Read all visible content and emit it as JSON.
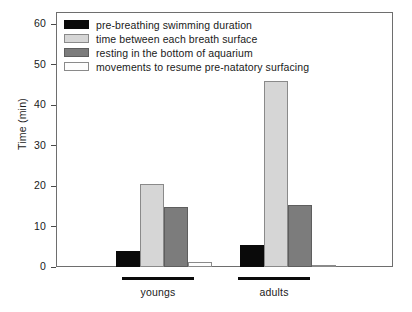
{
  "chart_data": {
    "type": "bar",
    "title": "",
    "xlabel": "",
    "ylabel": "Time (min)",
    "ylim": [
      0,
      63
    ],
    "yticks": [
      0,
      10,
      20,
      30,
      40,
      50,
      60
    ],
    "ytick_labels": [
      "0",
      "10",
      "20",
      "30",
      "40",
      "50",
      "60"
    ],
    "grid": false,
    "legend_position": "upper-left-inside",
    "categories": [
      "youngs",
      "adults"
    ],
    "series": [
      {
        "name": "pre-breathing swimming duration",
        "color": "#0a0a0a",
        "values": [
          4.0,
          5.4
        ]
      },
      {
        "name": "time between each breath surface",
        "color": "#d6d6d6",
        "values": [
          20.6,
          46.0
        ]
      },
      {
        "name": "resting in the bottom of aquarium",
        "color": "#7c7c7c",
        "values": [
          14.9,
          15.3
        ]
      },
      {
        "name": "movements to resume pre-natatory surfacing",
        "color": "#fdfdfd",
        "values": [
          1.3,
          0.3
        ]
      }
    ]
  },
  "axis": {
    "y_title": "Time (min)"
  },
  "legend": {
    "items": [
      {
        "label": "pre-breathing swimming duration"
      },
      {
        "label": "time between each breath surface"
      },
      {
        "label": "resting in the bottom of aquarium"
      },
      {
        "label": "movements to resume pre-natatory surfacing"
      }
    ]
  },
  "groups": [
    {
      "label": "youngs"
    },
    {
      "label": "adults"
    }
  ]
}
